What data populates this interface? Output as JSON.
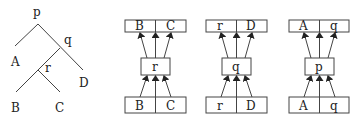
{
  "tree": {
    "root": "p",
    "nodes": [
      {
        "label": "p",
        "children": [
          "A",
          "q"
        ]
      },
      {
        "label": "q",
        "children": [
          "r",
          "D"
        ]
      },
      {
        "label": "r",
        "children": [
          "B",
          "C"
        ]
      }
    ],
    "leaves": [
      "A",
      "B",
      "C",
      "D"
    ]
  },
  "reductions": [
    {
      "top": [
        "B",
        "C"
      ],
      "middle": "r",
      "bottom": [
        "B",
        "C"
      ]
    },
    {
      "top": [
        "r",
        "D"
      ],
      "middle": "q",
      "bottom": [
        "r",
        "D"
      ]
    },
    {
      "top": [
        "A",
        "q"
      ],
      "middle": "p",
      "bottom": [
        "A",
        "q"
      ]
    }
  ]
}
